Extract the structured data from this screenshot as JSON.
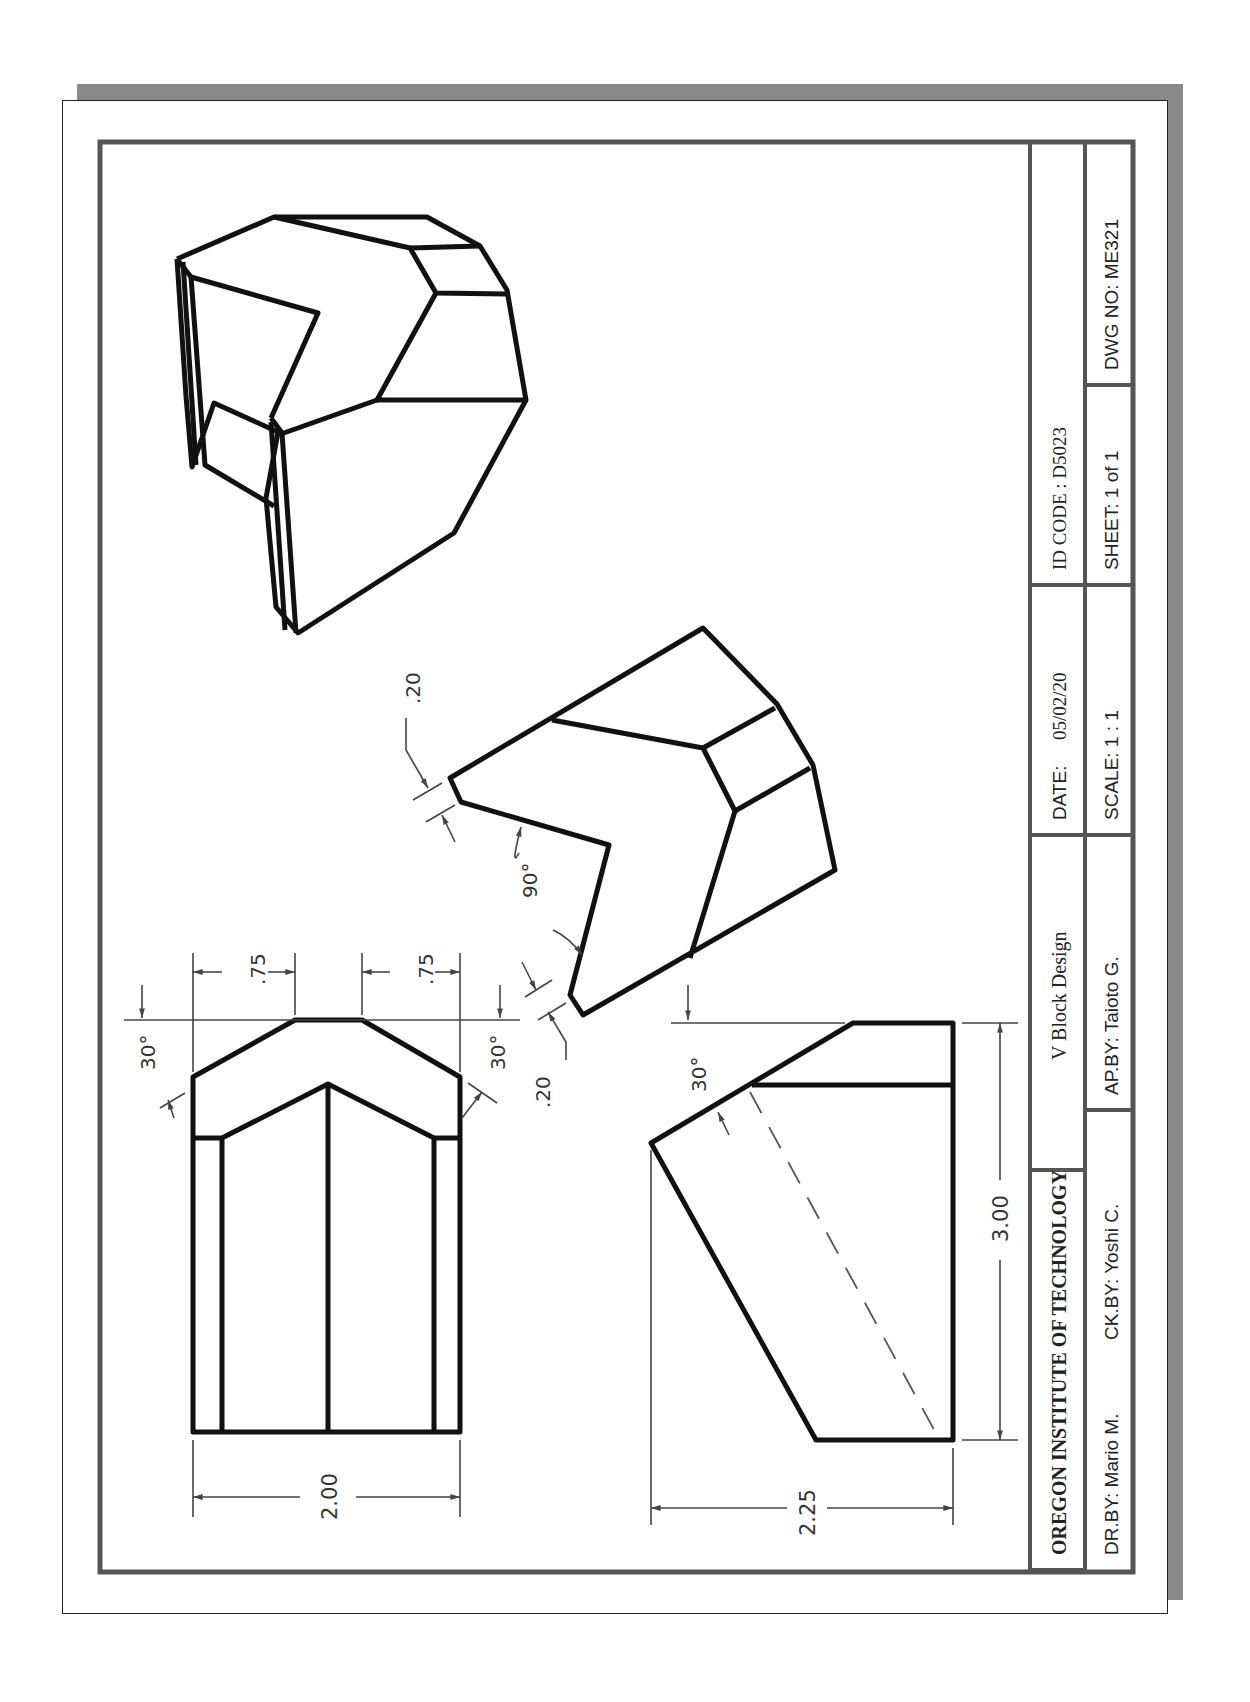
{
  "drawing": {
    "title": "V Block Design",
    "views": {
      "isometric": {
        "label": "isometric-view"
      },
      "auxiliary": {
        "dims": {
          "top_offset": ".20",
          "bottom_offset": ".20",
          "v_angle": "90°"
        }
      },
      "front": {
        "dims": {
          "left_chamfer_width": ".75",
          "right_chamfer_width": ".75",
          "left_angle": "30°",
          "right_angle": "30°",
          "overall_width": "2.00"
        }
      },
      "side": {
        "dims": {
          "angle": "30°",
          "height": "3.00",
          "depth": "2.25"
        }
      }
    }
  },
  "title_block": {
    "institution": "OREGON INSTITUTE OF TECHNOLOGY",
    "title": "V Block Design",
    "date_label": "DATE:",
    "date_value": "05/02/20",
    "id_code": "ID CODE : D5023",
    "drawn_by": "DR.BY: Mario M.",
    "checked_by": "CK.BY: Yoshi C.",
    "approved_by": "AP.BY: Taioto G.",
    "scale": "SCALE: 1 : 1",
    "sheet": "SHEET:  1 of 1",
    "dwg_no": "DWG NO:  ME321"
  },
  "colors": {
    "line": "#111111",
    "dim": "#444444",
    "border": "#555555",
    "shadow": "#8a8a8a"
  }
}
